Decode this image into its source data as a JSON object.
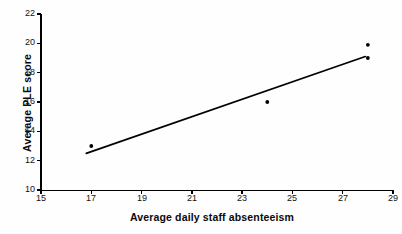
{
  "chart_data": {
    "type": "scatter",
    "title": "",
    "xlabel": "Average daily staff absenteeism",
    "ylabel": "Average PLE score",
    "xlim": [
      15,
      29
    ],
    "ylim": [
      10,
      22
    ],
    "xticks": [
      15,
      17,
      19,
      21,
      23,
      25,
      27,
      29
    ],
    "yticks": [
      10,
      12,
      14,
      16,
      18,
      20,
      22
    ],
    "xtick_labels": [
      "15",
      "17",
      "19",
      "21",
      "23",
      "25",
      "27",
      "29"
    ],
    "ytick_labels": [
      "10",
      "12",
      "14",
      "16",
      "18",
      "20",
      "22"
    ],
    "grid": false,
    "legend": false,
    "series": [
      {
        "name": "observations",
        "marker": "dot",
        "color": "#000000",
        "points": [
          {
            "x": 17.0,
            "y": 13.0
          },
          {
            "x": 24.0,
            "y": 16.0
          },
          {
            "x": 28.0,
            "y": 19.9
          },
          {
            "x": 28.0,
            "y": 19.0
          }
        ]
      },
      {
        "name": "trend-line",
        "type": "line",
        "color": "#000000",
        "points": [
          {
            "x": 16.8,
            "y": 12.5
          },
          {
            "x": 27.9,
            "y": 19.1
          }
        ]
      }
    ]
  },
  "axes": {
    "x_title": "Average daily staff absenteeism",
    "y_title": "Average PLE score"
  },
  "ticks": {
    "x": [
      "15",
      "17",
      "19",
      "21",
      "23",
      "25",
      "27",
      "29"
    ],
    "y": [
      "22",
      "20",
      "18",
      "16",
      "14",
      "12",
      "10"
    ]
  },
  "colors": {
    "axis": "#000000",
    "marker": "#000000",
    "line": "#000000",
    "background": "#fefefe",
    "text": "#111111"
  }
}
